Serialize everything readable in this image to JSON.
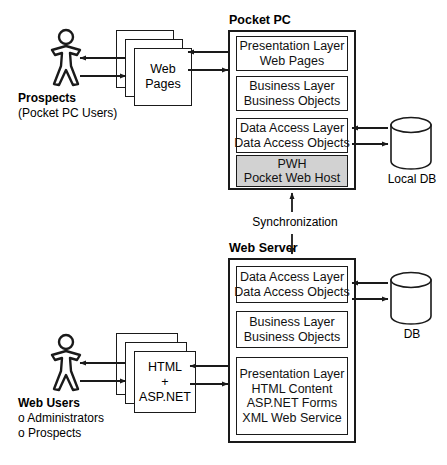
{
  "diagram": {
    "background": "#ffffff",
    "line_color": "#1a1a1a",
    "shaded_fill": "#d2d2d2"
  },
  "pocket_pc": {
    "title": "Pocket PC",
    "layers": [
      {
        "line1": "Presentation Layer",
        "line2": "Web Pages",
        "shaded": false
      },
      {
        "line1": "Business Layer",
        "line2": "Business Objects",
        "shaded": false
      },
      {
        "line1": "Data Access Layer",
        "line2": "Data Access Objects",
        "shaded": false
      },
      {
        "line1": "PWH",
        "line2": "Pocket Web Host",
        "shaded": true
      }
    ]
  },
  "web_server": {
    "title": "Web Server",
    "layers": [
      {
        "line1": "Data Access Layer",
        "line2": "Data Access Objects",
        "line3": "",
        "line4": ""
      },
      {
        "line1": "Business Layer",
        "line2": "Business Objects",
        "line3": "",
        "line4": ""
      },
      {
        "line1": "Presentation Layer",
        "line2": "HTML Content",
        "line3": "ASP.NET Forms",
        "line4": "XML Web Service"
      }
    ]
  },
  "sync": {
    "label": "Synchronization"
  },
  "actors": {
    "top": {
      "icon": "person-icon",
      "name": "Prospects",
      "detail": "(Pocket PC Users)"
    },
    "bottom": {
      "icon": "person-icon",
      "name": "Web Users",
      "detail_1": "o Administrators",
      "detail_2": "o Prospects"
    }
  },
  "cards": {
    "top": {
      "line1": "Web",
      "line2": "Pages",
      "line3": ""
    },
    "bottom": {
      "line1": "HTML",
      "line2": "+",
      "line3": "ASP.NET"
    }
  },
  "databases": {
    "local": {
      "icon": "database-cylinder-icon",
      "label": "Local DB"
    },
    "server": {
      "icon": "database-cylinder-icon",
      "label": "DB"
    }
  }
}
